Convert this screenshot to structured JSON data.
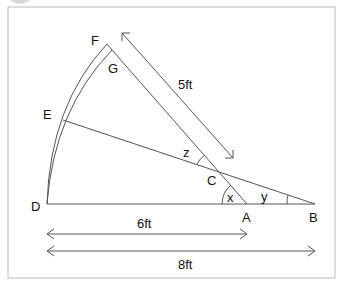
{
  "diagram": {
    "points": {
      "F": {
        "label": "F",
        "x": 107,
        "y": 44
      },
      "G": {
        "label": "G",
        "x": 112,
        "y": 50
      },
      "E": {
        "label": "E",
        "x": 63,
        "y": 120
      },
      "D": {
        "label": "D",
        "x": 47,
        "y": 204
      },
      "C": {
        "label": "C",
        "x": 219,
        "y": 171
      },
      "A": {
        "label": "A",
        "x": 247,
        "y": 204
      },
      "B": {
        "label": "B",
        "x": 315,
        "y": 204
      }
    },
    "angles": {
      "x": "x",
      "y": "y",
      "z": "z"
    },
    "measurements": {
      "slant": "5ft",
      "da": "6ft",
      "db": "8ft"
    },
    "colors": {
      "line": "#555555",
      "border": "#bbbbbb",
      "text": "#111111"
    }
  }
}
